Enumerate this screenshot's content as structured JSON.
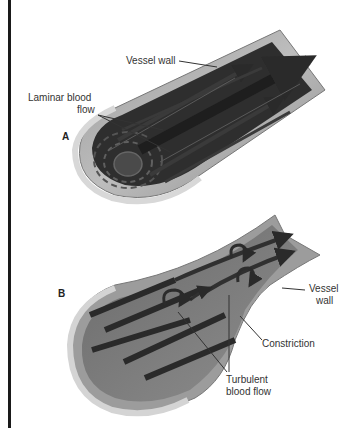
{
  "figure": {
    "panel_a": {
      "letter": "A",
      "labels": {
        "vessel_wall": "Vessel wall",
        "laminar_line1": "Laminar blood",
        "laminar_line2": "flow"
      }
    },
    "panel_b": {
      "letter": "B",
      "labels": {
        "vessel_wall_line1": "Vessel",
        "vessel_wall_line2": "wall",
        "constriction": "Constriction",
        "turbulent_line1": "Turbulent",
        "turbulent_line2": "blood flow"
      }
    },
    "colors": {
      "wall_outer": "#c8c8c8",
      "wall_inner": "#8a8a8a",
      "lumen_dark": "#2b2b2b",
      "stream": "#3a3a3a",
      "stream_highlight": "#6a6a6a",
      "label_text": "#333333",
      "border": "#1a1a1a"
    }
  }
}
